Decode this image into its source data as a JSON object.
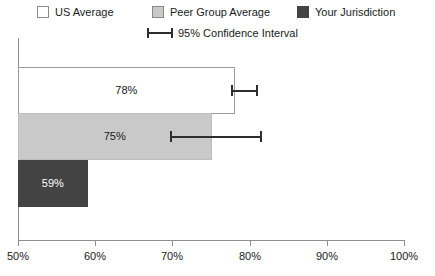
{
  "chart_data": {
    "type": "bar",
    "orientation": "horizontal",
    "title": "",
    "xlabel": "",
    "ylabel": "",
    "xlim": [
      50,
      100
    ],
    "grid": false,
    "legend_position": "top",
    "x_ticks": [
      {
        "value": 50,
        "label": "50%"
      },
      {
        "value": 60,
        "label": "60%"
      },
      {
        "value": 70,
        "label": "70%"
      },
      {
        "value": 80,
        "label": "80%"
      },
      {
        "value": 90,
        "label": "90%"
      },
      {
        "value": 100,
        "label": "100%"
      }
    ],
    "categories": [
      "US Average",
      "Peer Group Average",
      "Your Jurisdiction"
    ],
    "values": [
      78,
      75,
      59
    ],
    "data_labels": [
      "78%",
      "75%",
      "59%"
    ],
    "bars": [
      {
        "category": "US Average",
        "value": 78,
        "label": "78%",
        "color": "#ffffff",
        "border_color": "#9a9a9a",
        "label_color": "dark",
        "ci_low": 77.5,
        "ci_high": 81.0,
        "has_ci": true
      },
      {
        "category": "Peer Group Average",
        "value": 75,
        "label": "75%",
        "color": "#c9c9c9",
        "border_color": "#bdbdbd",
        "label_color": "dark",
        "ci_low": 69.7,
        "ci_high": 81.5,
        "has_ci": true
      },
      {
        "category": "Your Jurisdiction",
        "value": 59,
        "label": "59%",
        "color": "#434343",
        "border_color": "#434343",
        "label_color": "light",
        "ci_low": null,
        "ci_high": null,
        "has_ci": false
      }
    ],
    "legend": [
      {
        "label": "US Average",
        "color": "#ffffff",
        "swatch": "swatch-us"
      },
      {
        "label": "Peer Group Average",
        "color": "#c9c9c9",
        "swatch": "swatch-peer"
      },
      {
        "label": "Your Jurisdiction",
        "color": "#434343",
        "swatch": "swatch-your"
      },
      {
        "label": "95% Confidence Interval",
        "color": "#2e2e2e",
        "swatch": "ci-marker"
      }
    ]
  },
  "legend": {
    "us_average": "US Average",
    "peer_group_average": "Peer Group Average",
    "your_jurisdiction": "Your Jurisdiction",
    "confidence_interval": "95% Confidence Interval"
  },
  "axis": {
    "tick_50": "50%",
    "tick_60": "60%",
    "tick_70": "70%",
    "tick_80": "80%",
    "tick_90": "90%",
    "tick_100": "100%"
  },
  "bar_labels": {
    "us": "78%",
    "peer": "75%",
    "your": "59%"
  }
}
